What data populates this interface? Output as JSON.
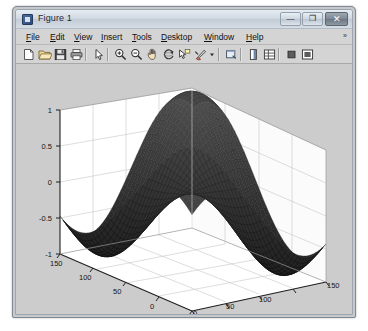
{
  "window": {
    "title": "Figure 1",
    "icon": "matlab-figure-icon",
    "controls": [
      {
        "name": "minimize",
        "glyph": "—"
      },
      {
        "name": "maximize",
        "glyph": "❐"
      },
      {
        "name": "close",
        "glyph": "✕"
      }
    ]
  },
  "menu": {
    "items": [
      {
        "label": "File",
        "mnemonic": "F",
        "x": 8
      },
      {
        "label": "Edit",
        "mnemonic": "E",
        "x": 32
      },
      {
        "label": "View",
        "mnemonic": "V",
        "x": 56
      },
      {
        "label": "Insert",
        "mnemonic": "I",
        "x": 82
      },
      {
        "label": "Tools",
        "mnemonic": "T",
        "x": 112
      },
      {
        "label": "Desktop",
        "mnemonic": "D",
        "x": 141
      },
      {
        "label": "Window",
        "mnemonic": "W",
        "x": 184
      },
      {
        "label": "Help",
        "mnemonic": "H",
        "x": 225
      }
    ],
    "overflow_glyph": "»"
  },
  "toolbar": {
    "buttons": [
      {
        "name": "new-figure-icon",
        "tip": "New Figure",
        "x": 5
      },
      {
        "name": "open-file-icon",
        "tip": "Open File",
        "x": 21
      },
      {
        "name": "save-figure-icon",
        "tip": "Save Figure",
        "x": 37
      },
      {
        "name": "print-figure-icon",
        "tip": "Print Figure",
        "x": 53
      },
      {
        "name": "pointer-icon",
        "tip": "Edit Plot",
        "x": 75
      },
      {
        "name": "zoom-in-icon",
        "tip": "Zoom In",
        "x": 97
      },
      {
        "name": "zoom-out-icon",
        "tip": "Zoom Out",
        "x": 113
      },
      {
        "name": "pan-icon",
        "tip": "Pan",
        "x": 129
      },
      {
        "name": "rotate-3d-icon",
        "tip": "Rotate 3D",
        "x": 145
      },
      {
        "name": "data-cursor-icon",
        "tip": "Data Cursor",
        "x": 161
      },
      {
        "name": "brush-icon",
        "tip": "Brush/Select Data",
        "x": 177
      },
      {
        "name": "brush-dropdown-icon",
        "tip": "Brush Options",
        "x": 193
      },
      {
        "name": "link-plot-icon",
        "tip": "Link Plot",
        "x": 208
      },
      {
        "name": "insert-colorbar-icon",
        "tip": "Insert Colorbar",
        "x": 230
      },
      {
        "name": "insert-legend-icon",
        "tip": "Insert Legend",
        "x": 246
      },
      {
        "name": "hide-plot-tools-icon",
        "tip": "Hide Plot Tools",
        "x": 268
      },
      {
        "name": "show-plot-tools-icon",
        "tip": "Show Plot Tools",
        "x": 284
      }
    ],
    "separators": [
      69,
      91,
      202,
      224,
      262
    ]
  },
  "colors": {
    "figure_background": "#cccccc",
    "axes_wall": "#ffffff",
    "grid_line": "#c0c0c0",
    "axis_line": "#2a2a2a",
    "mesh_dark": "#2a2a2a",
    "mesh_mid": "#4e4e4e",
    "tick_label": "#1a1a1a",
    "title_bar": "#d2dae3"
  },
  "chart_data": {
    "type": "surface",
    "title": "",
    "xlabel": "",
    "ylabel": "",
    "zlabel": "",
    "projection": "3d-mesh",
    "grid": true,
    "legend": "none",
    "x_ticks": [
      0,
      50,
      100,
      150
    ],
    "y_ticks": [
      0,
      50,
      100,
      150
    ],
    "z_ticks": [
      -1,
      -0.5,
      0,
      0.5,
      1
    ],
    "xlim": [
      0,
      150
    ],
    "ylim": [
      0,
      150
    ],
    "zlim": [
      -1,
      1
    ],
    "view_azimuth": -37.5,
    "view_elevation": 30,
    "surface_formula": "z = sin(x) * sin(y)",
    "peaks": [
      {
        "x": 75,
        "y": 75,
        "z": 1.0
      },
      {
        "x": 28,
        "y": 118,
        "z": 0.72
      },
      {
        "x": 122,
        "y": 32,
        "z": 0.7
      }
    ],
    "valleys": [
      {
        "x": 28,
        "y": 28,
        "z": -0.95
      },
      {
        "x": 122,
        "y": 122,
        "z": -0.95
      },
      {
        "x": 75,
        "y": 20,
        "z": -0.85
      },
      {
        "x": 20,
        "y": 75,
        "z": -0.85
      }
    ]
  }
}
